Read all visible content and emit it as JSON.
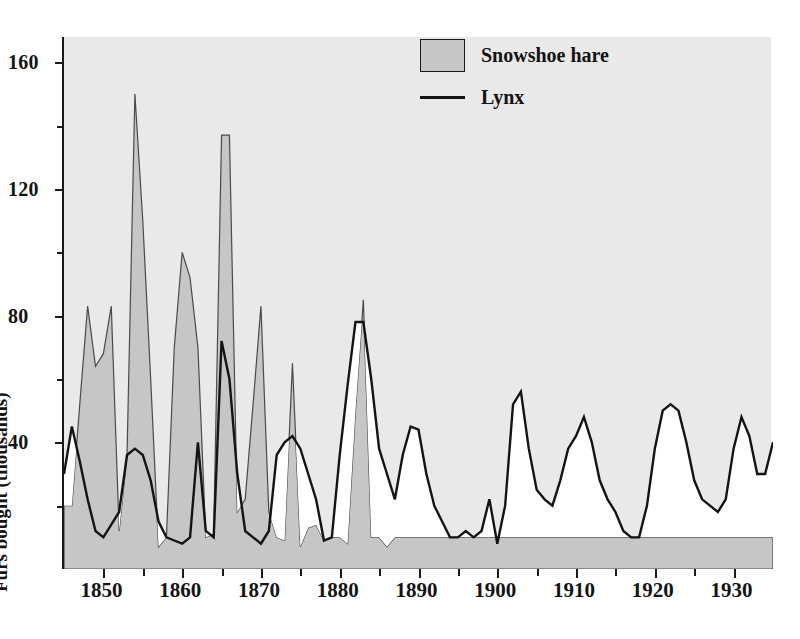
{
  "chart_data": {
    "type": "area",
    "title": "",
    "subtitle": "",
    "xlabel": "",
    "ylabel": "Furs bought (thousands)",
    "xlim": [
      1845,
      1935
    ],
    "ylim": [
      0,
      168
    ],
    "grid": false,
    "legend_position": "top-center-right",
    "y_ticks_major": [
      40,
      80,
      120,
      160
    ],
    "y_ticks_minor": [
      20,
      60,
      100,
      140
    ],
    "y_tick_labels": [
      "40",
      "80",
      "120",
      "160"
    ],
    "x_ticks_major": [
      1850,
      1860,
      1870,
      1880,
      1890,
      1900,
      1910,
      1920,
      1930
    ],
    "x_tick_labels": [
      "1850",
      "1860",
      "1870",
      "1880",
      "1890",
      "1900",
      "1910",
      "1920",
      "1930"
    ],
    "x_ticks_minor": [
      1845,
      1855,
      1865,
      1875,
      1885,
      1895,
      1905,
      1915,
      1925,
      1935
    ],
    "x": [
      1845,
      1846,
      1847,
      1848,
      1849,
      1850,
      1851,
      1852,
      1853,
      1854,
      1855,
      1856,
      1857,
      1858,
      1859,
      1860,
      1861,
      1862,
      1863,
      1864,
      1865,
      1866,
      1867,
      1868,
      1869,
      1870,
      1871,
      1872,
      1873,
      1874,
      1875,
      1876,
      1877,
      1878,
      1879,
      1880,
      1881,
      1882,
      1883,
      1884,
      1885,
      1886,
      1887,
      1888,
      1889,
      1890,
      1891,
      1892,
      1893,
      1894,
      1895,
      1896,
      1897,
      1898,
      1899,
      1900,
      1901,
      1902,
      1903,
      1904,
      1905,
      1906,
      1907,
      1908,
      1909,
      1910,
      1911,
      1912,
      1913,
      1914,
      1915,
      1916,
      1917,
      1918,
      1919,
      1920,
      1921,
      1922,
      1923,
      1924,
      1925,
      1926,
      1927,
      1928,
      1929,
      1930,
      1931,
      1932,
      1933,
      1934,
      1935
    ],
    "series": [
      {
        "name": "Snowshoe hare",
        "style": "filled-area",
        "color": "#c6c6c6",
        "values": [
          20,
          20,
          52,
          83,
          64,
          68,
          83,
          12,
          36,
          150,
          110,
          60,
          7,
          10,
          70,
          100,
          92,
          70,
          10,
          11,
          137,
          137,
          18,
          22,
          52,
          83,
          18,
          10,
          9,
          65,
          7,
          13,
          14,
          9,
          10,
          10,
          8,
          50,
          85,
          10,
          10,
          7,
          10,
          10,
          10,
          10,
          10,
          10,
          10,
          10,
          10,
          10,
          10,
          10,
          10,
          10,
          10,
          10,
          10,
          10,
          10,
          10,
          10,
          10,
          10,
          10,
          10,
          10,
          10,
          10,
          10,
          10,
          10,
          10,
          10,
          10,
          10,
          10,
          10,
          10,
          10,
          10,
          10,
          10,
          10,
          10,
          10,
          10,
          10,
          10,
          10
        ]
      },
      {
        "name": "Lynx",
        "style": "line",
        "color": "#141414",
        "values": [
          30,
          45,
          34,
          22,
          12,
          10,
          14,
          18,
          36,
          38,
          36,
          28,
          15,
          10,
          9,
          8,
          10,
          40,
          12,
          10,
          72,
          60,
          30,
          12,
          10,
          8,
          12,
          36,
          40,
          42,
          38,
          30,
          22,
          9,
          10,
          36,
          58,
          78,
          78,
          60,
          38,
          30,
          22,
          36,
          45,
          44,
          30,
          20,
          15,
          10,
          10,
          12,
          10,
          12,
          22,
          8,
          20,
          52,
          56,
          38,
          25,
          22,
          20,
          28,
          38,
          42,
          48,
          40,
          28,
          22,
          18,
          12,
          10,
          10,
          20,
          38,
          50,
          52,
          50,
          40,
          28,
          22,
          20,
          18,
          22,
          38,
          48,
          42,
          30,
          30,
          40
        ]
      }
    ],
    "annotations": [],
    "legend": [
      {
        "label": "Snowshoe hare",
        "marker": "filled-square",
        "color": "#c6c6c6"
      },
      {
        "label": "Lynx",
        "marker": "line",
        "color": "#141414"
      }
    ]
  },
  "axis": {
    "y_title": "Furs bought (thousands)"
  },
  "legend": {
    "hare_label": "Snowshoe hare",
    "lynx_label": "Lynx"
  },
  "colors": {
    "background": "#e9e9e9",
    "hare_fill": "#c6c6c6",
    "lynx_line": "#141414",
    "axis": "#1a1a1a",
    "page": "#ffffff"
  }
}
